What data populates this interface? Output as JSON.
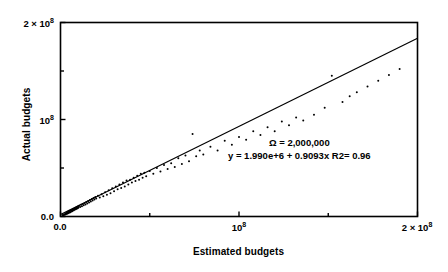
{
  "figure": {
    "background": "#ffffff",
    "foreground": "#000000"
  },
  "annotation": {
    "line1": "Ω = 2,000,000",
    "line2": "y = 1.990e+6 + 0.9093x R2= 0.96"
  },
  "axis": {
    "y_title": "Actual budgets",
    "x_title": "Estimated budgets",
    "y_tick_0": "0.0",
    "y_tick_1_mantissa": "10",
    "y_tick_1_exp": "8",
    "y_tick_2_mantissa": "2 × 10",
    "y_tick_2_exp": "8",
    "x_tick_0": "0.0",
    "x_tick_1_mantissa": "10",
    "x_tick_1_exp": "8",
    "x_tick_2_mantissa": "2 × 10",
    "x_tick_2_exp": "8"
  },
  "chart_data": {
    "type": "scatter",
    "title": "",
    "xlabel": "Estimated budgets",
    "ylabel": "Actual budgets",
    "xlim": [
      0,
      200000000
    ],
    "ylim": [
      0,
      200000000
    ],
    "xticks": [
      0,
      100000000,
      200000000
    ],
    "xticklabels": [
      "0.0",
      "10^8",
      "2 x 10^8"
    ],
    "yticks": [
      0,
      100000000,
      200000000
    ],
    "yticklabels": [
      "0.0",
      "10^8",
      "2 x 10^8"
    ],
    "minor_tick_interval": 50000000,
    "grid": false,
    "legend": null,
    "frame": "full-box",
    "marker": {
      "shape": "circle",
      "color": "#000000",
      "size_px": 2
    },
    "annotations": [
      {
        "text": "Ω = 2,000,000",
        "x": 140000000,
        "y": 63000000
      },
      {
        "text": "y = 1.990e+6 + 0.9093x R2= 0.96",
        "x": 140000000,
        "y": 56000000
      }
    ],
    "regression": {
      "intercept": 1990000,
      "slope": 0.9093,
      "r_squared": 0.96,
      "equation": "y = 1.990e+6 + 0.9093x",
      "line_color": "#000000",
      "x_start": 0,
      "x_end": 200000000
    },
    "n_points": 122,
    "points": [
      [
        1200000,
        1500000
      ],
      [
        1600000,
        1100000
      ],
      [
        2000000,
        2400000
      ],
      [
        2400000,
        1800000
      ],
      [
        2800000,
        3200000
      ],
      [
        3000000,
        2200000
      ],
      [
        3200000,
        3600000
      ],
      [
        3500000,
        2800000
      ],
      [
        3800000,
        4200000
      ],
      [
        4000000,
        3100000
      ],
      [
        4200000,
        4800000
      ],
      [
        4500000,
        3500000
      ],
      [
        4800000,
        5200000
      ],
      [
        5000000,
        4100000
      ],
      [
        5200000,
        5800000
      ],
      [
        5500000,
        4500000
      ],
      [
        5800000,
        6200000
      ],
      [
        6000000,
        5100000
      ],
      [
        6200000,
        6800000
      ],
      [
        6500000,
        5500000
      ],
      [
        6800000,
        7200000
      ],
      [
        7000000,
        6100000
      ],
      [
        7200000,
        7800000
      ],
      [
        7500000,
        6500000
      ],
      [
        7800000,
        8200000
      ],
      [
        8000000,
        7100000
      ],
      [
        8200000,
        8800000
      ],
      [
        8500000,
        7500000
      ],
      [
        8800000,
        9200000
      ],
      [
        9000000,
        8100000
      ],
      [
        9200000,
        9800000
      ],
      [
        9500000,
        8500000
      ],
      [
        9800000,
        10200000
      ],
      [
        10000000,
        9100000
      ],
      [
        10500000,
        11000000
      ],
      [
        11000000,
        9800000
      ],
      [
        11500000,
        12000000
      ],
      [
        12000000,
        10500000
      ],
      [
        12500000,
        13000000
      ],
      [
        13000000,
        11500000
      ],
      [
        13500000,
        14000000
      ],
      [
        14000000,
        12500000
      ],
      [
        14500000,
        15000000
      ],
      [
        15000000,
        13500000
      ],
      [
        15500000,
        16000000
      ],
      [
        16000000,
        14500000
      ],
      [
        16500000,
        17000000
      ],
      [
        17000000,
        15500000
      ],
      [
        17500000,
        18000000
      ],
      [
        18000000,
        16500000
      ],
      [
        18500000,
        19000000
      ],
      [
        19000000,
        17500000
      ],
      [
        19500000,
        20000000
      ],
      [
        20000000,
        18500000
      ],
      [
        21000000,
        21500000
      ],
      [
        22000000,
        19500000
      ],
      [
        23000000,
        23000000
      ],
      [
        24000000,
        21000000
      ],
      [
        25000000,
        25000000
      ],
      [
        26000000,
        22500000
      ],
      [
        27000000,
        27000000
      ],
      [
        28000000,
        24000000
      ],
      [
        29000000,
        29000000
      ],
      [
        30000000,
        26000000
      ],
      [
        31000000,
        31000000
      ],
      [
        32000000,
        28000000
      ],
      [
        33000000,
        33000000
      ],
      [
        34000000,
        29500000
      ],
      [
        35000000,
        35000000
      ],
      [
        36000000,
        31000000
      ],
      [
        37000000,
        37000000
      ],
      [
        38000000,
        33000000
      ],
      [
        39000000,
        38000000
      ],
      [
        40000000,
        35000000
      ],
      [
        41000000,
        40000000
      ],
      [
        42000000,
        36500000
      ],
      [
        43000000,
        42000000
      ],
      [
        44000000,
        38000000
      ],
      [
        45000000,
        44000000
      ],
      [
        46000000,
        40000000
      ],
      [
        47000000,
        45000000
      ],
      [
        48000000,
        41500000
      ],
      [
        50000000,
        47000000
      ],
      [
        52000000,
        44000000
      ],
      [
        54000000,
        50000000
      ],
      [
        56000000,
        46500000
      ],
      [
        58000000,
        53000000
      ],
      [
        60000000,
        49000000
      ],
      [
        62000000,
        55000000
      ],
      [
        64000000,
        51000000
      ],
      [
        66000000,
        60000000
      ],
      [
        68000000,
        54000000
      ],
      [
        70000000,
        63000000
      ],
      [
        72000000,
        57000000
      ],
      [
        74000000,
        85000000
      ],
      [
        76000000,
        62000000
      ],
      [
        78000000,
        68000000
      ],
      [
        80000000,
        64000000
      ],
      [
        84000000,
        72000000
      ],
      [
        88000000,
        68000000
      ],
      [
        92000000,
        78000000
      ],
      [
        96000000,
        74000000
      ],
      [
        100000000,
        82000000
      ],
      [
        104000000,
        79000000
      ],
      [
        108000000,
        88000000
      ],
      [
        112000000,
        84000000
      ],
      [
        116000000,
        92000000
      ],
      [
        120000000,
        88000000
      ],
      [
        124000000,
        98000000
      ],
      [
        128000000,
        94000000
      ],
      [
        132000000,
        102000000
      ],
      [
        136000000,
        99000000
      ],
      [
        142000000,
        105000000
      ],
      [
        148000000,
        112000000
      ],
      [
        152000000,
        145000000
      ],
      [
        158000000,
        118000000
      ],
      [
        162000000,
        124000000
      ],
      [
        166000000,
        128000000
      ],
      [
        172000000,
        134000000
      ],
      [
        178000000,
        140000000
      ],
      [
        184000000,
        146000000
      ],
      [
        190000000,
        152000000
      ]
    ]
  }
}
